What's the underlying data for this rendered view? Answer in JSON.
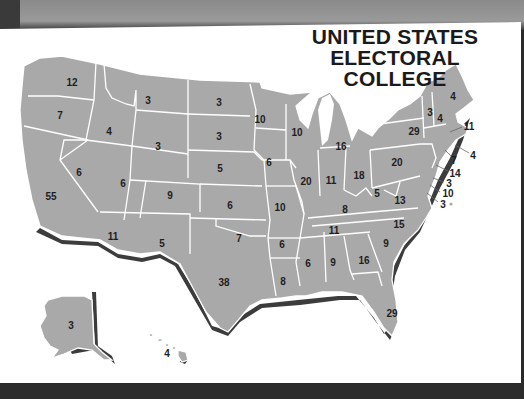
{
  "title": {
    "line1": "UNITED STATES",
    "line2": "ELECTORAL COLLEGE"
  },
  "colors": {
    "state_fill": "#a9a9a9",
    "border": "#ffffff",
    "shadow": "#3c3c3c",
    "background": "#ffffff",
    "text": "#1e1e1e"
  },
  "states": [
    {
      "name": "Washington",
      "votes": "12",
      "x": 72,
      "y": 82
    },
    {
      "name": "Oregon",
      "votes": "7",
      "x": 60,
      "y": 115
    },
    {
      "name": "California",
      "votes": "55",
      "x": 51,
      "y": 196
    },
    {
      "name": "Nevada",
      "votes": "6",
      "x": 79,
      "y": 172
    },
    {
      "name": "Idaho",
      "votes": "4",
      "x": 109,
      "y": 131
    },
    {
      "name": "Montana",
      "votes": "3",
      "x": 148,
      "y": 100
    },
    {
      "name": "Wyoming",
      "votes": "3",
      "x": 158,
      "y": 146
    },
    {
      "name": "Utah",
      "votes": "6",
      "x": 123,
      "y": 183
    },
    {
      "name": "Colorado",
      "votes": "9",
      "x": 170,
      "y": 195
    },
    {
      "name": "Arizona",
      "votes": "11",
      "x": 113,
      "y": 236
    },
    {
      "name": "New Mexico",
      "votes": "5",
      "x": 162,
      "y": 243
    },
    {
      "name": "North Dakota",
      "votes": "3",
      "x": 219,
      "y": 102
    },
    {
      "name": "South Dakota",
      "votes": "3",
      "x": 219,
      "y": 136
    },
    {
      "name": "Nebraska",
      "votes": "5",
      "x": 220,
      "y": 168
    },
    {
      "name": "Kansas",
      "votes": "6",
      "x": 230,
      "y": 205
    },
    {
      "name": "Oklahoma",
      "votes": "7",
      "x": 239,
      "y": 238
    },
    {
      "name": "Texas",
      "votes": "38",
      "x": 224,
      "y": 282
    },
    {
      "name": "Minnesota",
      "votes": "10",
      "x": 260,
      "y": 119
    },
    {
      "name": "Iowa",
      "votes": "6",
      "x": 269,
      "y": 162
    },
    {
      "name": "Missouri",
      "votes": "10",
      "x": 280,
      "y": 207
    },
    {
      "name": "Arkansas",
      "votes": "6",
      "x": 282,
      "y": 244
    },
    {
      "name": "Louisiana",
      "votes": "8",
      "x": 283,
      "y": 281
    },
    {
      "name": "Wisconsin",
      "votes": "10",
      "x": 297,
      "y": 132
    },
    {
      "name": "Illinois",
      "votes": "20",
      "x": 306,
      "y": 181
    },
    {
      "name": "Michigan",
      "votes": "16",
      "x": 341,
      "y": 146
    },
    {
      "name": "Indiana",
      "votes": "11",
      "x": 331,
      "y": 180
    },
    {
      "name": "Ohio",
      "votes": "18",
      "x": 359,
      "y": 175
    },
    {
      "name": "Kentucky",
      "votes": "8",
      "x": 345,
      "y": 209
    },
    {
      "name": "Tennessee",
      "votes": "11",
      "x": 334,
      "y": 230
    },
    {
      "name": "Mississippi",
      "votes": "6",
      "x": 308,
      "y": 263
    },
    {
      "name": "Alabama",
      "votes": "9",
      "x": 333,
      "y": 262
    },
    {
      "name": "Georgia",
      "votes": "16",
      "x": 364,
      "y": 260
    },
    {
      "name": "Florida",
      "votes": "29",
      "x": 392,
      "y": 313
    },
    {
      "name": "South Carolina",
      "votes": "9",
      "x": 386,
      "y": 243
    },
    {
      "name": "North Carolina",
      "votes": "15",
      "x": 399,
      "y": 224
    },
    {
      "name": "Virginia",
      "votes": "13",
      "x": 400,
      "y": 200
    },
    {
      "name": "West Virginia",
      "votes": "5",
      "x": 377,
      "y": 193
    },
    {
      "name": "Pennsylvania",
      "votes": "20",
      "x": 397,
      "y": 162
    },
    {
      "name": "New York",
      "votes": "29",
      "x": 414,
      "y": 131
    },
    {
      "name": "Vermont",
      "votes": "3",
      "x": 430,
      "y": 112
    },
    {
      "name": "New Hampshire",
      "votes": "4",
      "x": 440,
      "y": 118
    },
    {
      "name": "Maine",
      "votes": "4",
      "x": 453,
      "y": 96
    },
    {
      "name": "Alaska",
      "votes": "3",
      "x": 71,
      "y": 325
    },
    {
      "name": "Hawaii",
      "votes": "4",
      "x": 167,
      "y": 353
    }
  ],
  "callouts": [
    {
      "name": "Massachusetts",
      "votes": "11",
      "x": 469,
      "y": 126,
      "lx1": 450,
      "ly1": 132,
      "lx2": 462,
      "ly2": 127
    },
    {
      "name": "Rhode Island",
      "votes": "4",
      "x": 473,
      "y": 155,
      "lx1": 455,
      "ly1": 145,
      "lx2": 469,
      "ly2": 153
    },
    {
      "name": "Connecticut",
      "votes": "7",
      "x": 454,
      "y": 160,
      "lx1": 445,
      "ly1": 150,
      "lx2": 451,
      "ly2": 156
    },
    {
      "name": "New Jersey",
      "votes": "14",
      "x": 455,
      "y": 173,
      "lx1": 436,
      "ly1": 165,
      "lx2": 448,
      "ly2": 171
    },
    {
      "name": "Delaware",
      "votes": "3",
      "x": 449,
      "y": 183,
      "lx1": 433,
      "ly1": 178,
      "lx2": 444,
      "ly2": 182
    },
    {
      "name": "Maryland",
      "votes": "10",
      "x": 448,
      "y": 193,
      "lx1": 430,
      "ly1": 185,
      "lx2": 440,
      "ly2": 192
    },
    {
      "name": "District of Columbia",
      "votes": "3",
      "x": 443,
      "y": 204,
      "lx1": 427,
      "ly1": 193,
      "lx2": 438,
      "ly2": 202
    }
  ]
}
